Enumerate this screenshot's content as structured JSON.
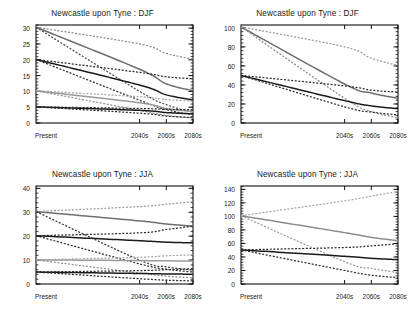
{
  "figure": {
    "background": "#ffffff",
    "layout": "2x2 grid of line charts",
    "panel_count": 4
  },
  "chart_data": [
    {
      "id": "top-left",
      "type": "line",
      "title": "Newcastle upon Tyne : DJF",
      "xlabel": "",
      "ylabel": "",
      "x": [
        "Present",
        "2040s",
        "2060s",
        "2080s"
      ],
      "xtick_labels": [
        "Present",
        "2040s",
        "2060s",
        "2080s"
      ],
      "xtick_positions": [
        0,
        0.66,
        0.83,
        1.0
      ],
      "ytick_labels": [
        "0",
        "5",
        "10",
        "15",
        "20",
        "25",
        "30"
      ],
      "ylim": [
        0,
        31
      ],
      "grid": false,
      "legend": "none",
      "series": [
        {
          "name": "RP30 central",
          "style": "solid",
          "color": "#6e6e6e",
          "values": [
            30.3,
            17.0,
            12.4,
            10.2
          ]
        },
        {
          "name": "RP30 upper",
          "style": "dashed",
          "color": "#8c8c8c",
          "values": [
            30.3,
            25.0,
            22.0,
            20.2
          ]
        },
        {
          "name": "RP30 lower",
          "style": "dashed",
          "color": "#4d4d4d",
          "values": [
            30.3,
            10.0,
            5.8,
            3.4
          ]
        },
        {
          "name": "RP20 central",
          "style": "solid",
          "color": "#1a1a1a",
          "values": [
            20.1,
            12.0,
            8.9,
            7.3
          ]
        },
        {
          "name": "RP20 upper",
          "style": "dashed",
          "color": "#2b2b2b",
          "values": [
            20.1,
            16.0,
            14.6,
            14.0
          ]
        },
        {
          "name": "RP20 lower",
          "style": "dashed",
          "color": "#2b2b2b",
          "values": [
            20.1,
            7.2,
            4.2,
            2.6
          ]
        },
        {
          "name": "RP10 central",
          "style": "solid",
          "color": "#9a9a9a",
          "values": [
            10.2,
            6.4,
            4.6,
            3.6
          ]
        },
        {
          "name": "RP10 upper",
          "style": "dashed",
          "color": "#a6a6a6",
          "values": [
            10.2,
            8.3,
            7.4,
            7.0
          ]
        },
        {
          "name": "RP10 lower",
          "style": "dashed",
          "color": "#8f8f8f",
          "values": [
            10.2,
            4.0,
            2.4,
            1.6
          ]
        },
        {
          "name": "RP5 central",
          "style": "solid",
          "color": "#1a1a1a",
          "values": [
            5.1,
            4.0,
            3.3,
            2.9
          ]
        },
        {
          "name": "RP5 upper",
          "style": "dashed",
          "color": "#2b2b2b",
          "values": [
            5.1,
            4.6,
            4.3,
            4.2
          ]
        },
        {
          "name": "RP5 lower",
          "style": "dashed",
          "color": "#2b2b2b",
          "values": [
            5.1,
            3.1,
            2.2,
            1.7
          ]
        }
      ]
    },
    {
      "id": "top-right",
      "type": "line",
      "title": "Newcastle upon Tyne : DJF",
      "xlabel": "",
      "ylabel": "",
      "x": [
        "Present",
        "2040s",
        "2060s",
        "2080s"
      ],
      "xtick_labels": [
        "Present",
        "2040s",
        "2060s",
        "2080s"
      ],
      "xtick_positions": [
        0,
        0.66,
        0.83,
        1.0
      ],
      "ytick_labels": [
        "0",
        "20",
        "40",
        "60",
        "80",
        "100"
      ],
      "ylim": [
        0,
        103
      ],
      "grid": false,
      "legend": "none",
      "series": [
        {
          "name": "RP100 central",
          "style": "solid",
          "color": "#6e6e6e",
          "values": [
            101.0,
            41.0,
            31.5,
            26.0
          ]
        },
        {
          "name": "RP100 upper",
          "style": "dashed",
          "color": "#9a9a9a",
          "values": [
            101.0,
            80.0,
            68.0,
            60.5
          ]
        },
        {
          "name": "RP100 lower",
          "style": "dashed",
          "color": "#8c8c8c",
          "values": [
            101.0,
            26.0,
            12.0,
            5.5
          ]
        },
        {
          "name": "RP50 central",
          "style": "solid",
          "color": "#1a1a1a",
          "values": [
            50.0,
            23.5,
            18.0,
            15.0
          ]
        },
        {
          "name": "RP50 upper",
          "style": "dashed",
          "color": "#2b2b2b",
          "values": [
            50.0,
            39.0,
            34.5,
            32.5
          ]
        },
        {
          "name": "RP50 lower",
          "style": "dashed",
          "color": "#2b2b2b",
          "values": [
            50.0,
            17.0,
            11.5,
            8.5
          ]
        }
      ]
    },
    {
      "id": "bottom-left",
      "type": "line",
      "title": "Newcastle upon Tyne : JJA",
      "xlabel": "",
      "ylabel": "",
      "x": [
        "Present",
        "2040s",
        "2060s",
        "2080s"
      ],
      "xtick_labels": [
        "Present",
        "2040s",
        "2060s",
        "2080s"
      ],
      "xtick_positions": [
        0,
        0.66,
        0.83,
        1.0
      ],
      "ytick_labels": [
        "0",
        "10",
        "20",
        "30",
        "40"
      ],
      "ylim": [
        0,
        41
      ],
      "grid": false,
      "legend": "none",
      "series": [
        {
          "name": "RP30 central",
          "style": "solid",
          "color": "#6e6e6e",
          "values": [
            30.3,
            26.4,
            25.1,
            24.2
          ]
        },
        {
          "name": "RP30 upper",
          "style": "dashed",
          "color": "#9a9a9a",
          "values": [
            30.3,
            32.4,
            33.4,
            34.4
          ]
        },
        {
          "name": "RP30 lower",
          "style": "dashed",
          "color": "#3b3b3b",
          "values": [
            30.3,
            10.0,
            7.2,
            5.8
          ]
        },
        {
          "name": "RP20 central",
          "style": "solid",
          "color": "#1a1a1a",
          "values": [
            20.2,
            18.1,
            17.5,
            17.2
          ]
        },
        {
          "name": "RP20 upper",
          "style": "dashed",
          "color": "#2b2b2b",
          "values": [
            20.2,
            21.4,
            22.8,
            24.2
          ]
        },
        {
          "name": "RP20 lower",
          "style": "dashed",
          "color": "#2b2b2b",
          "values": [
            20.2,
            8.4,
            6.2,
            5.0
          ]
        },
        {
          "name": "RP10 central",
          "style": "solid",
          "color": "#9a9a9a",
          "values": [
            10.1,
            9.8,
            9.7,
            9.6
          ]
        },
        {
          "name": "RP10 upper",
          "style": "dashed",
          "color": "#a6a6a6",
          "values": [
            10.1,
            11.2,
            11.8,
            12.2
          ]
        },
        {
          "name": "RP10 lower",
          "style": "dashed",
          "color": "#8f8f8f",
          "values": [
            10.1,
            4.6,
            3.3,
            2.6
          ]
        },
        {
          "name": "RP5 central",
          "style": "solid",
          "color": "#1a1a1a",
          "values": [
            5.0,
            4.4,
            4.2,
            4.1
          ]
        },
        {
          "name": "RP5 upper",
          "style": "dashed",
          "color": "#2b2b2b",
          "values": [
            5.0,
            5.6,
            6.0,
            6.4
          ]
        },
        {
          "name": "RP5 lower",
          "style": "dashed",
          "color": "#2b2b2b",
          "values": [
            5.0,
            2.2,
            1.6,
            1.3
          ]
        }
      ]
    },
    {
      "id": "bottom-right",
      "type": "line",
      "title": "Newcastle upon Tyne : JJA",
      "xlabel": "",
      "ylabel": "",
      "x": [
        "Present",
        "2040s",
        "2060s",
        "2080s"
      ],
      "xtick_labels": [
        "Present",
        "2040s",
        "2060s",
        "2080s"
      ],
      "xtick_positions": [
        0,
        0.66,
        0.83,
        1.0
      ],
      "ytick_labels": [
        "0",
        "20",
        "40",
        "60",
        "80",
        "100",
        "120",
        "140"
      ],
      "ylim": [
        0,
        145
      ],
      "grid": false,
      "legend": "none",
      "series": [
        {
          "name": "RP100 central",
          "style": "solid",
          "color": "#8c8c8c",
          "values": [
            101.0,
            76.0,
            69.0,
            64.0
          ]
        },
        {
          "name": "RP100 upper",
          "style": "dashed",
          "color": "#a6a6a6",
          "values": [
            101.0,
            123.0,
            130.0,
            137.0
          ]
        },
        {
          "name": "RP100 lower",
          "style": "dashed",
          "color": "#9a9a9a",
          "values": [
            101.0,
            33.0,
            23.0,
            17.0
          ]
        },
        {
          "name": "RP50 central",
          "style": "solid",
          "color": "#1a1a1a",
          "values": [
            50.5,
            41.0,
            38.0,
            36.0
          ]
        },
        {
          "name": "RP50 upper",
          "style": "dashed",
          "color": "#2b2b2b",
          "values": [
            50.5,
            54.0,
            56.5,
            59.5
          ]
        },
        {
          "name": "RP50 lower",
          "style": "dashed",
          "color": "#2b2b2b",
          "values": [
            50.5,
            20.0,
            13.0,
            9.5
          ]
        }
      ]
    }
  ]
}
